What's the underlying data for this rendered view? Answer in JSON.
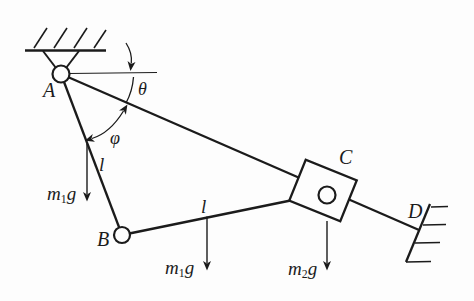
{
  "figure_type": "mechanics-linkage-diagram",
  "colors": {
    "ink": "#1b1b1b",
    "background": "#fdfdfd"
  },
  "diagram": {
    "points": {
      "pivot": "A",
      "joint": "B",
      "slider": "C",
      "wall": "D"
    },
    "angles": {
      "theta": "θ",
      "phi": "φ"
    },
    "lengths": {
      "rod_ab": "l",
      "rod_bc": "l"
    },
    "forces": {
      "rod_ab_weight": {
        "base": "m",
        "sub": "1",
        "tail": "g"
      },
      "rod_bc_weight": {
        "base": "m",
        "sub": "1",
        "tail": "g"
      },
      "slider_weight": {
        "base": "m",
        "sub": "2",
        "tail": "g"
      }
    }
  }
}
